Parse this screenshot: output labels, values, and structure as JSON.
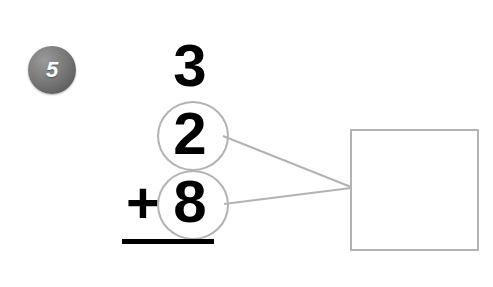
{
  "worksheet": {
    "problem_number": "5",
    "background_color": "#ffffff",
    "ink_color": "#000000",
    "guide_color": "#b3b3b3",
    "badge_color": "#757575"
  },
  "problem": {
    "type": "vertical-addition",
    "top_addend": "3",
    "middle_addend": "2",
    "bottom_addend": "8",
    "operator": "+",
    "answer_value": "",
    "answer_placeholder": ""
  },
  "annotations": {
    "circle_middle_label": "2",
    "circle_bottom_label": "8",
    "connector_count": "2"
  }
}
